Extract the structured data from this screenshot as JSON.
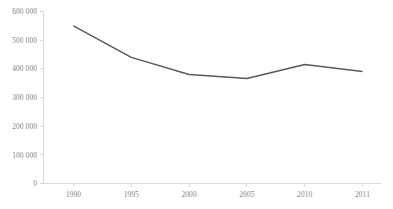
{
  "chart_data": {
    "type": "line",
    "title": "",
    "subtitle": "",
    "xlabel": "",
    "ylabel": "",
    "categories": [
      "1990",
      "1995",
      "2000",
      "2005",
      "2010",
      "2011"
    ],
    "series": [
      {
        "name": "",
        "values": [
          550000,
          440000,
          380000,
          366000,
          415000,
          391000
        ]
      }
    ],
    "ylim": [
      0,
      600000
    ],
    "y_ticks": [
      0,
      100000,
      200000,
      300000,
      400000,
      500000,
      600000
    ],
    "y_tick_labels": [
      "0",
      "100 000",
      "200 000",
      "300 000",
      "400 000",
      "500 000",
      "600 000"
    ],
    "x_tick_labels": [
      "1990",
      "1995",
      "2000",
      "2005",
      "2010",
      "2011"
    ],
    "grid": false,
    "legend": "none",
    "markers": false,
    "colors": {
      "line": "#595959",
      "axis": "#d9d9d9",
      "text": "#7f7f7f",
      "background": "#ffffff"
    }
  }
}
